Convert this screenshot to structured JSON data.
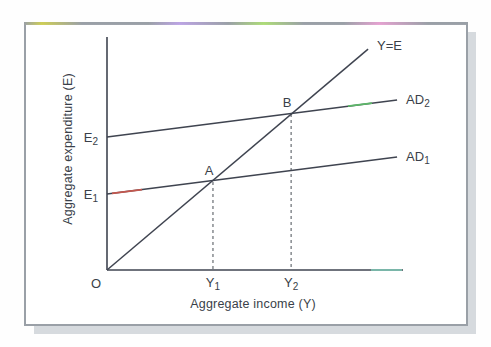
{
  "figure": {
    "background": "#fefefe",
    "frame": {
      "border_color": "#9aa0a7",
      "fill": "#ffffff",
      "shadow_color": "#d6dade",
      "top_edge_tints": [
        "#cfcf52",
        "#bda4e6",
        "#aede76",
        "#e7a2d2"
      ]
    }
  },
  "chart_data": {
    "type": "line",
    "title": "",
    "xlabel": "Aggregate income (Y)",
    "ylabel": "Aggregate expenditure (E)",
    "origin_label": "O",
    "grid": false,
    "legend": "none",
    "axis_ranges": {
      "x": [
        0,
        1
      ],
      "y": [
        0,
        1
      ]
    },
    "line_color": "#3f4450",
    "text_color": "#3a3f49",
    "dropline_color": "#5a5f66",
    "series": [
      {
        "name": "Y=E",
        "label_base": "Y=E",
        "label_sub": "",
        "points": [
          [
            0,
            0
          ],
          [
            0.882,
            0.948
          ]
        ]
      },
      {
        "name": "AD2",
        "label_base": "AD",
        "label_sub": "2",
        "points": [
          [
            0,
            0.571
          ],
          [
            0.98,
            0.73
          ]
        ]
      },
      {
        "name": "AD1",
        "label_base": "AD",
        "label_sub": "1",
        "points": [
          [
            0,
            0.326
          ],
          [
            0.98,
            0.485
          ]
        ]
      }
    ],
    "equilibrium_points": [
      {
        "name": "A",
        "x": 0.358,
        "y": 0.382,
        "dropline_to_x_tick": "Y1"
      },
      {
        "name": "B",
        "x": 0.622,
        "y": 0.674,
        "dropline_to_x_tick": "Y2"
      }
    ],
    "x_ticks": [
      {
        "base": "Y",
        "sub": "1",
        "at": 0.358
      },
      {
        "base": "Y",
        "sub": "2",
        "at": 0.622
      }
    ],
    "y_ticks": [
      {
        "base": "E",
        "sub": "1",
        "at": 0.326
      },
      {
        "base": "E",
        "sub": "2",
        "at": 0.571
      }
    ],
    "scan_tints": [
      {
        "target": "AD1",
        "px_from": 112,
        "px_to": 142,
        "color": "#c4574e"
      },
      {
        "target": "AD2",
        "px_from": 348,
        "px_to": 372,
        "color": "#5cb768"
      },
      {
        "target": "x-axis",
        "px_from": 371,
        "px_to": 402,
        "color": "#7cc3b1"
      }
    ]
  }
}
